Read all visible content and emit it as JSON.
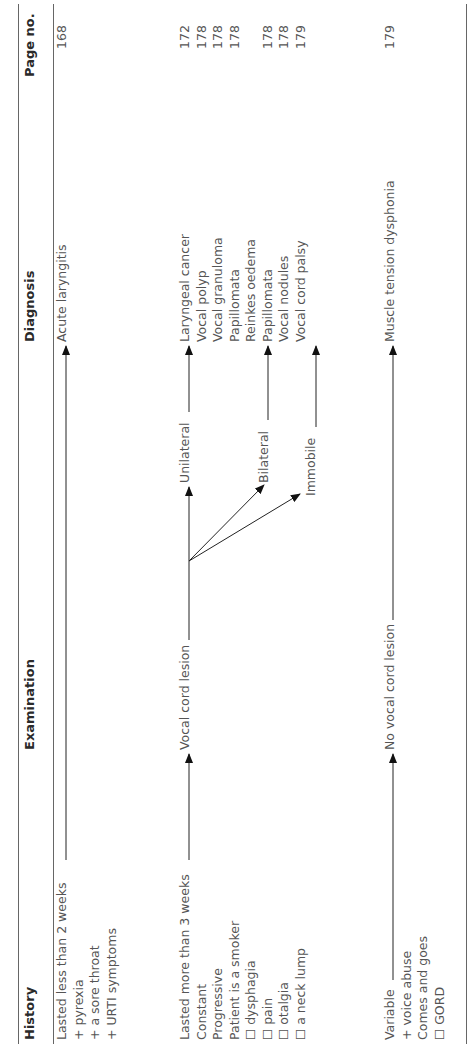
{
  "table": {
    "headers": {
      "history": "History",
      "examination": "Examination",
      "diagnosis": "Diagnosis",
      "page_no": "Page no."
    },
    "group1": {
      "history": [
        "Lasted less than 2 weeks",
        "+ pyrexia",
        "+ a sore throat",
        "+ URTI symptoms"
      ],
      "diagnosis": "Acute laryngitis",
      "page": "168"
    },
    "group2": {
      "history": [
        "Lasted more than 3 weeks",
        "Constant",
        "Progressive",
        "Patient is a smoker",
        "☐ dysphagia",
        "☐ pain",
        "☐ otalgia",
        "☐ a neck lump"
      ],
      "examination": "Vocal cord lesion",
      "branches": {
        "unilateral": "Unilateral",
        "bilateral": "Bilateral",
        "immobile": "Immobile"
      },
      "diagnoses_unilateral": [
        "Laryngeal cancer",
        "Vocal polyp",
        "Vocal granuloma",
        "Papillomata"
      ],
      "pages_unilateral": [
        "172",
        "178",
        "178",
        "178"
      ],
      "diagnoses_bilateral": [
        "Reinkes oedema",
        "Papillomata",
        "Vocal nodules"
      ],
      "pages_bilateral": [
        "",
        "178",
        "178"
      ],
      "diagnoses_immobile": [
        "Vocal cord palsy"
      ],
      "pages_immobile": [
        "179"
      ]
    },
    "group3": {
      "history": [
        "Variable",
        "+ voice abuse",
        "Comes and goes",
        "☐ GORD"
      ],
      "examination": "No vocal cord lesion",
      "diagnosis": "Muscle tension dysphonia",
      "page": "179"
    }
  },
  "colors": {
    "line": "#666666",
    "text": "#555555",
    "header": "#2a2a2a",
    "arrow": "#111111"
  }
}
